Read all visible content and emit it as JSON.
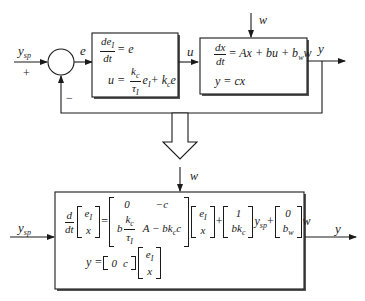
{
  "top_diagram": {
    "input_label": "y",
    "input_sub": "sp",
    "plus_sign": "+",
    "minus_sign": "−",
    "error_label": "e",
    "controller_block": {
      "line1_lhs_num": "de",
      "line1_lhs_num_sub": "I",
      "line1_lhs_den": "dt",
      "line1_rhs": "= e",
      "line2_lhs": "u =",
      "line2_frac_num": "k",
      "line2_frac_num_sub": "c",
      "line2_frac_den": "τ",
      "line2_frac_den_sub": "I",
      "line2_rest_e": "e",
      "line2_rest_e_sub": "I",
      "line2_plus": "+ k",
      "line2_plus_sub": "c",
      "line2_tail": "e"
    },
    "control_label": "u",
    "disturbance_label": "w",
    "plant_block": {
      "line1_num": "dx",
      "line1_den": "dt",
      "line1_rhs": "= Ax + bu + b",
      "line1_rhs_sub": "w",
      "line1_tail": "w",
      "line2": "y = cx"
    },
    "output_label": "y"
  },
  "transform_arrow": "hollow-down-arrow",
  "bottom_diagram": {
    "input_label": "y",
    "input_sub": "sp",
    "disturbance_label": "w",
    "output_label": "y",
    "state_equation": {
      "d_num": "d",
      "d_den": "dt",
      "state_vec": [
        "e_I",
        "x"
      ],
      "equals": "=",
      "A_matrix": [
        [
          "0",
          "−c"
        ],
        [
          "b k_c/τ_I",
          "A − bk_c c"
        ]
      ],
      "state_vec2": [
        "e_I",
        "x"
      ],
      "plus1": "+",
      "B_vec": [
        "1",
        "bk_c"
      ],
      "ysp_label": "y",
      "ysp_sub": "sp",
      "plus2": "+",
      "W_vec": [
        "0",
        "b_w"
      ],
      "w_tail": "w"
    },
    "output_equation": {
      "lhs": "y =",
      "C_row": [
        "0",
        "c"
      ],
      "state_vec": [
        "e_I",
        "x"
      ]
    }
  },
  "colors": {
    "line": "#1a1a1a",
    "block_shadow": "#555555",
    "background": "#ffffff"
  }
}
